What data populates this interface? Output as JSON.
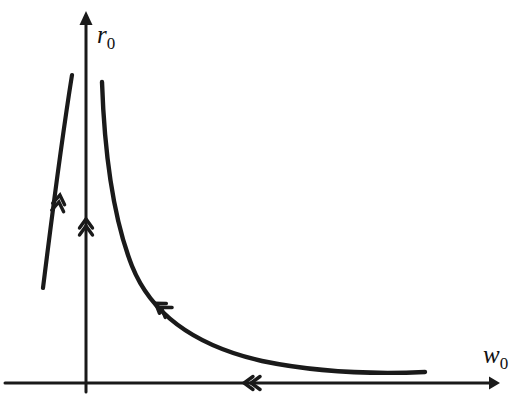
{
  "figure": {
    "type": "phase-plane-sketch",
    "background_color": "#ffffff",
    "stroke_color": "#1a1a1a",
    "axes": {
      "y_axis": {
        "label_var": "r",
        "label_sub": "0",
        "arrow": "up",
        "x_px": 86,
        "top_px": 12,
        "bottom_px": 392
      },
      "x_axis": {
        "label_var": "w",
        "label_sub": "0",
        "arrow": "right",
        "y_px": 383,
        "left_px": 5,
        "right_px": 497
      }
    },
    "curves": [
      {
        "name": "left-trajectory",
        "description": "near-vertical line left of the vertical axis, slanting up-right",
        "start_px": [
          43,
          288
        ],
        "end_px": [
          72,
          75
        ],
        "direction_marker": "double-chevron-up",
        "marker_px": [
          60,
          196
        ]
      },
      {
        "name": "hyperbola-trajectory",
        "description": "decaying hyperbola-like curve in the first quadrant, asymptotic to both axes",
        "start_px": [
          102,
          82
        ],
        "end_px": [
          425,
          372
        ],
        "direction_marker": "double-chevron-up-left",
        "marker_px": [
          157,
          306
        ]
      }
    ],
    "direction_markers": [
      {
        "name": "y-axis-flow-marker",
        "glyph": "double-chevron-up",
        "px": [
          86,
          223
        ]
      },
      {
        "name": "x-axis-flow-marker",
        "glyph": "double-chevron-left",
        "px": [
          247,
          383
        ]
      }
    ]
  },
  "labels": {
    "y_axis": {
      "var": "r",
      "sub": "0"
    },
    "x_axis": {
      "var": "w",
      "sub": "0"
    }
  }
}
